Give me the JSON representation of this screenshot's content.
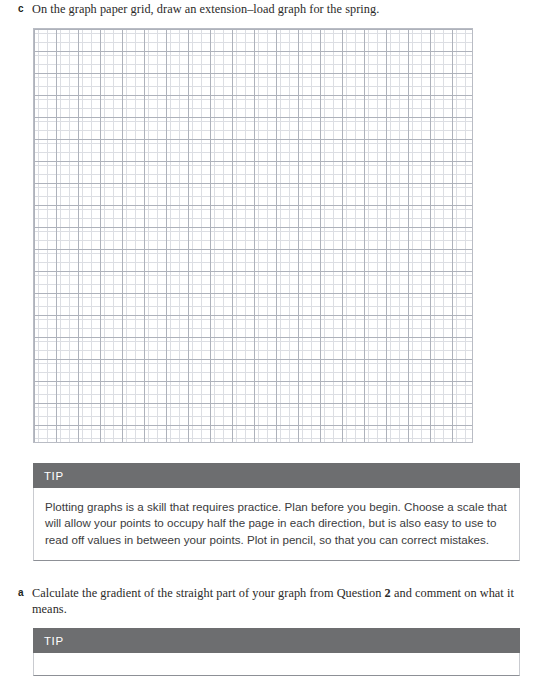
{
  "questions": [
    {
      "letter": "c",
      "text_before": "On the graph paper grid, draw an extension–load graph for the spring.",
      "text_bold": "",
      "text_after": ""
    },
    {
      "letter": "a",
      "text_before": "Calculate the gradient of the straight part of your graph from Question ",
      "text_bold": "2",
      "text_after": " and comment on what it means."
    }
  ],
  "graph_grid": {
    "label": "graph-paper-grid",
    "minor_cell_px": 4.4,
    "major_cell_px": 22,
    "minor_line_color": "#dcdee3",
    "major_line_color": "#aeb2bb",
    "border_color": "#b9bcc4"
  },
  "tips": [
    {
      "header": "TIP",
      "body": "Plotting graphs is a skill that requires practice. Plan before you begin. Choose a scale that will allow your points to occupy half the page in each direction, but is also easy to use to read off values in between your points. Plot in pencil, so that you can correct mistakes."
    },
    {
      "header": "TIP",
      "body": ""
    }
  ],
  "colors": {
    "tip_header_bg": "#6d6e70",
    "tip_header_text": "#ffffff",
    "body_text": "#3b3b3d",
    "question_text": "#2b2a29"
  }
}
